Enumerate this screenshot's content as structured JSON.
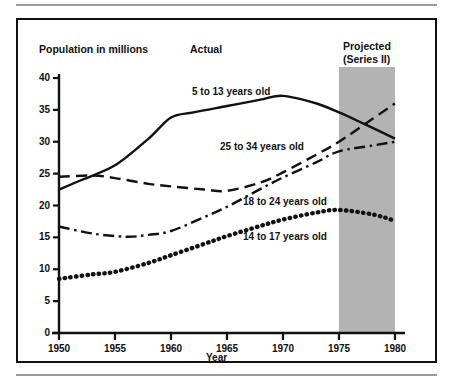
{
  "figure": {
    "axis_title": "Population in millions",
    "period_actual": "Actual",
    "period_projected_line1": "Projected",
    "period_projected_line2": "(Series II)"
  },
  "chart_data": {
    "type": "line",
    "title": "Population in millions",
    "xlabel": "Year",
    "ylabel": "Population in millions",
    "xlim": [
      1950,
      1980
    ],
    "ylim": [
      0,
      40
    ],
    "grid": false,
    "legend": "inline-annotations",
    "x_ticks": [
      "1950",
      "1955",
      "1960",
      "1965",
      "1970",
      "1975",
      "1980"
    ],
    "y_ticks": [
      "0",
      "5",
      "10",
      "15",
      "20",
      "25",
      "30",
      "35",
      "40"
    ],
    "shaded_region": {
      "label": "Projected (Series II)",
      "x_start": 1975,
      "x_end": 1980,
      "color": "#b3b3b3"
    },
    "annotations": [
      {
        "text": "Actual",
        "x": 1962
      },
      {
        "text": "Projected (Series II)",
        "x": 1977
      }
    ],
    "series": [
      {
        "name": "5 to 13 years old",
        "style": "solid",
        "color": "#111111",
        "x": [
          1950,
          1952,
          1955,
          1958,
          1960,
          1962,
          1965,
          1968,
          1970,
          1973,
          1975,
          1977,
          1980
        ],
        "values": [
          22.5,
          24.0,
          26.3,
          30.5,
          33.8,
          34.6,
          35.6,
          36.6,
          37.2,
          36.0,
          34.6,
          33.0,
          30.5
        ]
      },
      {
        "name": "25 to 34 years old",
        "style": "dashed",
        "color": "#111111",
        "x": [
          1950,
          1953,
          1955,
          1958,
          1960,
          1963,
          1965,
          1968,
          1970,
          1973,
          1975,
          1978,
          1980
        ],
        "values": [
          24.5,
          24.7,
          24.3,
          23.4,
          23.0,
          22.5,
          22.3,
          23.6,
          25.2,
          28.0,
          30.0,
          33.6,
          36.0
        ]
      },
      {
        "name": "18 to 24 years old",
        "style": "dashdot",
        "color": "#111111",
        "x": [
          1950,
          1953,
          1956,
          1958,
          1960,
          1963,
          1965,
          1968,
          1970,
          1973,
          1975,
          1978,
          1980
        ],
        "values": [
          16.7,
          15.6,
          15.1,
          15.4,
          16.0,
          18.2,
          19.8,
          22.6,
          24.4,
          26.8,
          28.5,
          29.4,
          30.0
        ]
      },
      {
        "name": "14 to 17 years old",
        "style": "dotted",
        "color": "#111111",
        "x": [
          1950,
          1953,
          1955,
          1958,
          1960,
          1963,
          1965,
          1968,
          1970,
          1973,
          1975,
          1978,
          1980
        ],
        "values": [
          8.5,
          9.2,
          9.6,
          11.0,
          12.2,
          14.0,
          15.2,
          16.8,
          17.8,
          18.9,
          19.3,
          18.6,
          17.6
        ]
      }
    ]
  }
}
